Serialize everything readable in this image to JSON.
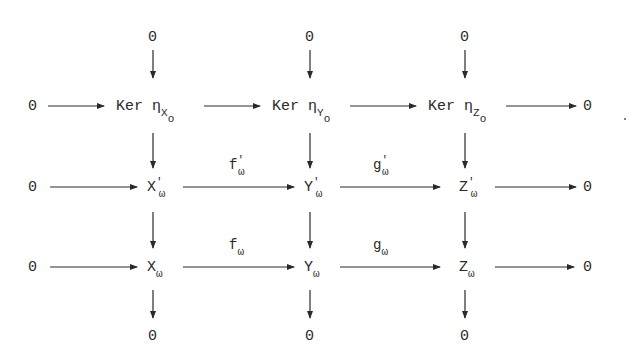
{
  "diagram": {
    "type": "commutative diagram",
    "zero": "0",
    "top_zeros": [
      "0",
      "0",
      "0"
    ],
    "bottom_zeros": [
      "0",
      "0",
      "0"
    ],
    "rows": [
      {
        "name": "kernel-row",
        "left": "0",
        "right": "0",
        "nodes": [
          {
            "text": "Ker η",
            "sub": "X",
            "subsub": "o"
          },
          {
            "text": "Ker η",
            "sub": "Y",
            "subsub": "o"
          },
          {
            "text": "Ker η",
            "sub": "Z",
            "subsub": "o"
          }
        ],
        "maps": []
      },
      {
        "name": "primed-row",
        "left": "0",
        "right": "0",
        "nodes": [
          {
            "text": "X",
            "sup": "'",
            "sub": "ω"
          },
          {
            "text": "Y",
            "sup": "'",
            "sub": "ω"
          },
          {
            "text": "Z",
            "sup": "'",
            "sub": "ω"
          }
        ],
        "maps": [
          {
            "text": "f",
            "sup": "'",
            "sub": "ω"
          },
          {
            "text": "g",
            "sup": "'",
            "sub": "ω"
          }
        ]
      },
      {
        "name": "omega-row",
        "left": "0",
        "right": "0",
        "nodes": [
          {
            "text": "X",
            "sub": "ω"
          },
          {
            "text": "Y",
            "sub": "ω"
          },
          {
            "text": "Z",
            "sub": "ω"
          }
        ],
        "maps": [
          {
            "text": "f",
            "sub": "ω"
          },
          {
            "text": "g",
            "sub": "ω"
          }
        ]
      }
    ],
    "trailing_mark": "."
  }
}
